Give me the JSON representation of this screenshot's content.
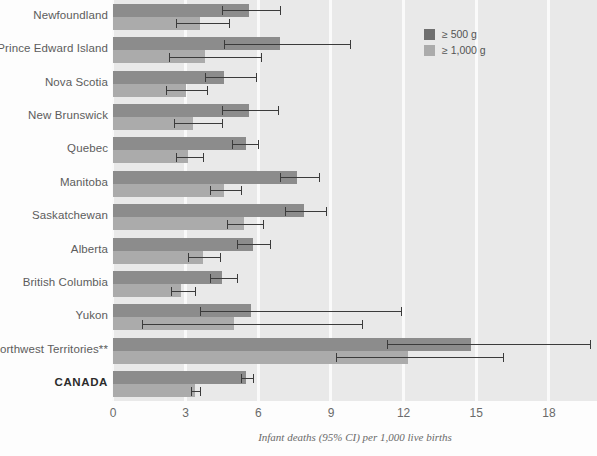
{
  "chart_data": {
    "type": "bar",
    "orientation": "horizontal",
    "title": "",
    "xlabel": "Infant deaths (95% CI) per 1,000 live births",
    "ylabel": "",
    "xlim": [
      0,
      18.6
    ],
    "xticks": [
      0,
      3,
      6,
      9,
      12,
      15,
      18
    ],
    "xtick_labels": [
      "0",
      "3",
      "6",
      "9",
      "12",
      "15",
      "18"
    ],
    "grid": true,
    "grid_axis": "x",
    "legend_position": "top-right",
    "categories": [
      "Newfoundland",
      "Prince Edward Island",
      "Nova Scotia",
      "New Brunswick",
      "Quebec",
      "Manitoba",
      "Saskatchewan",
      "Alberta",
      "British Columbia",
      "Yukon",
      "Northwest Territories**",
      "CANADA"
    ],
    "emphasized_categories": [
      "CANADA"
    ],
    "series": [
      {
        "name": "≥ 500 g",
        "color": "#8c8c8c",
        "values": [
          5.6,
          6.9,
          4.6,
          5.6,
          5.5,
          7.6,
          7.9,
          5.8,
          4.5,
          5.7,
          14.8,
          5.5
        ],
        "ci_low": [
          4.5,
          4.6,
          3.8,
          4.5,
          4.9,
          6.9,
          7.1,
          5.1,
          4.0,
          3.6,
          11.3,
          5.3
        ],
        "ci_high": [
          6.9,
          9.8,
          5.9,
          6.8,
          6.0,
          8.5,
          8.8,
          6.5,
          5.1,
          11.9,
          19.7,
          5.8
        ]
      },
      {
        "name": "≥ 1,000 g",
        "color": "#ababab",
        "values": [
          3.6,
          3.8,
          3.0,
          3.3,
          3.1,
          4.6,
          5.4,
          3.7,
          2.8,
          5.0,
          12.2,
          3.4
        ],
        "ci_low": [
          2.6,
          2.3,
          2.2,
          2.5,
          2.6,
          4.0,
          4.7,
          3.1,
          2.4,
          1.2,
          9.2,
          3.2
        ],
        "ci_high": [
          4.8,
          6.1,
          3.9,
          4.5,
          3.7,
          5.3,
          6.2,
          4.4,
          3.4,
          10.3,
          16.1,
          3.6
        ]
      }
    ]
  },
  "legend": {
    "items": [
      {
        "label": "≥ 500 g",
        "color": "#8c8c8c"
      },
      {
        "label": "≥ 1,000 g",
        "color": "#ababab"
      }
    ]
  },
  "axis": {
    "caption": "Infant deaths (95% CI) per 1,000 live births",
    "ticks": [
      "0",
      "3",
      "6",
      "9",
      "12",
      "15",
      "18"
    ]
  },
  "colors": {
    "plot_background": "#e9e9e9",
    "gridline": "#fafafa",
    "bar_dark": "#8c8c8c",
    "bar_light": "#ababab",
    "error_bar": "#3b3b3b",
    "label_text": "#5c5c5c"
  }
}
